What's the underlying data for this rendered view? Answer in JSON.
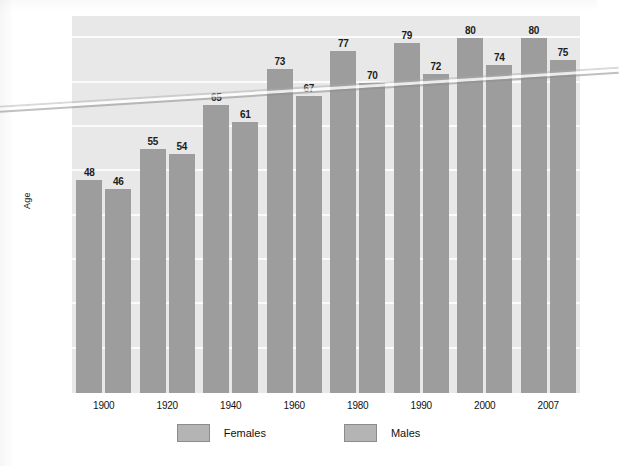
{
  "chart_data": {
    "type": "bar",
    "title": "",
    "subtitle": "",
    "xlabel": "",
    "ylabel": "Age",
    "categories": [
      "1900",
      "1920",
      "1940",
      "1960",
      "1980",
      "1990",
      "2000",
      "2007"
    ],
    "series": [
      {
        "name": "Females",
        "values": [
          48,
          55,
          65,
          73,
          77,
          79,
          80,
          80
        ],
        "color": "#9d9d9d"
      },
      {
        "name": "Males",
        "values": [
          46,
          54,
          61,
          67,
          70,
          72,
          74,
          75
        ],
        "color": "#9d9d9d"
      }
    ],
    "ylim": [
      0,
      85
    ],
    "yticks": [
      10,
      20,
      30,
      40,
      50,
      60,
      70,
      80
    ],
    "ytick_labels": [
      "10",
      "20",
      "30",
      "40",
      "50",
      "60",
      "70",
      "80"
    ],
    "grid": true,
    "grid_axis": "y",
    "legend_position": "bottom",
    "show_value_labels": true,
    "plot_background": "#e8e8e8",
    "gridline_color": "#fbfbfb"
  },
  "legend": {
    "items": [
      {
        "label": "Females",
        "swatch": "#b4b4b4"
      },
      {
        "label": "Males",
        "swatch": "#b4b4b4"
      }
    ]
  },
  "axes": {
    "y_title": "Age"
  }
}
